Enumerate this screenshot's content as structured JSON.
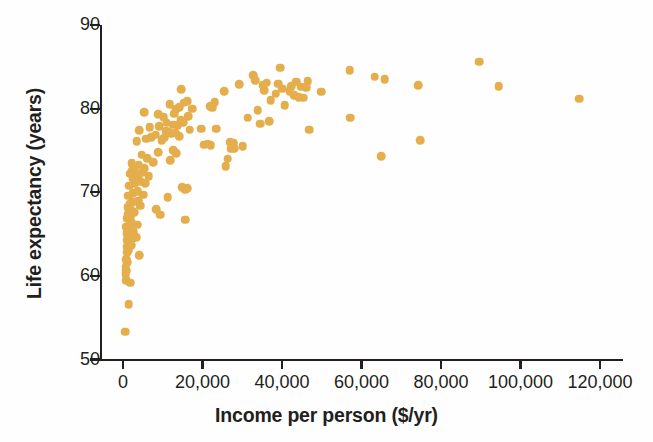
{
  "chart_data": {
    "type": "scatter",
    "title": "",
    "xlabel": "Income per person ($/yr)",
    "ylabel": "Life expectancy (years)",
    "xlim": [
      -4000,
      126000
    ],
    "ylim": [
      50,
      90
    ],
    "xticks": [
      0,
      20000,
      40000,
      60000,
      80000,
      100000,
      120000
    ],
    "xtick_labels": [
      "0",
      "20,000",
      "40,000",
      "60,000",
      "80,000",
      "100,000",
      "120,000"
    ],
    "yticks": [
      50,
      60,
      70,
      80,
      90
    ],
    "ytick_labels": [
      "50",
      "60",
      "70",
      "80",
      "90"
    ],
    "grid": false,
    "legend": null,
    "marker_color": "#e4ae4c",
    "axis_color": "#231f20",
    "marker_size": 8.6,
    "points": [
      [
        620,
        53.3
      ],
      [
        1460,
        56.6
      ],
      [
        1840,
        59.2
      ],
      [
        760,
        59.5
      ],
      [
        700,
        60.2
      ],
      [
        880,
        60.6
      ],
      [
        660,
        61.1
      ],
      [
        1010,
        61.6
      ],
      [
        820,
        62.0
      ],
      [
        4050,
        62.5
      ],
      [
        1130,
        62.8
      ],
      [
        1280,
        63.1
      ],
      [
        900,
        63.5
      ],
      [
        2020,
        63.7
      ],
      [
        1700,
        64.0
      ],
      [
        1090,
        64.3
      ],
      [
        2440,
        64.5
      ],
      [
        3300,
        64.6
      ],
      [
        1310,
        64.8
      ],
      [
        900,
        65.1
      ],
      [
        2650,
        65.3
      ],
      [
        1140,
        65.5
      ],
      [
        1560,
        65.7
      ],
      [
        760,
        65.9
      ],
      [
        3590,
        66.1
      ],
      [
        2120,
        66.4
      ],
      [
        15600,
        66.7
      ],
      [
        1020,
        66.9
      ],
      [
        1920,
        67.1
      ],
      [
        9300,
        67.3
      ],
      [
        1350,
        67.4
      ],
      [
        2890,
        67.6
      ],
      [
        2160,
        67.8
      ],
      [
        8400,
        68.0
      ],
      [
        1190,
        68.2
      ],
      [
        4300,
        68.4
      ],
      [
        1640,
        68.6
      ],
      [
        2380,
        68.8
      ],
      [
        3780,
        69.0
      ],
      [
        11200,
        69.4
      ],
      [
        1330,
        69.6
      ],
      [
        5150,
        69.7
      ],
      [
        2480,
        69.9
      ],
      [
        3650,
        70.1
      ],
      [
        15700,
        70.3
      ],
      [
        16200,
        70.5
      ],
      [
        14900,
        70.6
      ],
      [
        1520,
        70.8
      ],
      [
        2900,
        71.0
      ],
      [
        5600,
        71.1
      ],
      [
        4400,
        71.3
      ],
      [
        3120,
        71.5
      ],
      [
        2400,
        71.7
      ],
      [
        6500,
        71.9
      ],
      [
        3550,
        72.0
      ],
      [
        1850,
        72.2
      ],
      [
        4900,
        72.4
      ],
      [
        2280,
        72.6
      ],
      [
        2750,
        72.8
      ],
      [
        5300,
        72.9
      ],
      [
        25800,
        73.1
      ],
      [
        3900,
        73.3
      ],
      [
        2150,
        73.5
      ],
      [
        7600,
        73.6
      ],
      [
        11900,
        73.8
      ],
      [
        26300,
        74.0
      ],
      [
        6100,
        74.1
      ],
      [
        64900,
        74.3
      ],
      [
        4700,
        74.5
      ],
      [
        13400,
        74.7
      ],
      [
        8900,
        74.8
      ],
      [
        12700,
        75.0
      ],
      [
        27200,
        75.2
      ],
      [
        28000,
        75.3
      ],
      [
        30100,
        75.5
      ],
      [
        22100,
        75.6
      ],
      [
        20400,
        75.7
      ],
      [
        21300,
        75.8
      ],
      [
        27900,
        75.9
      ],
      [
        26900,
        76.0
      ],
      [
        3400,
        76.1
      ],
      [
        9700,
        76.2
      ],
      [
        5900,
        76.4
      ],
      [
        74700,
        76.2
      ],
      [
        10400,
        76.5
      ],
      [
        7100,
        76.6
      ],
      [
        14200,
        76.7
      ],
      [
        8200,
        76.9
      ],
      [
        12200,
        77.0
      ],
      [
        13100,
        77.1
      ],
      [
        11500,
        77.2
      ],
      [
        10900,
        77.3
      ],
      [
        4100,
        77.4
      ],
      [
        16800,
        77.5
      ],
      [
        19600,
        77.6
      ],
      [
        23400,
        77.6
      ],
      [
        46900,
        77.5
      ],
      [
        6700,
        77.8
      ],
      [
        9100,
        77.9
      ],
      [
        13800,
        78.0
      ],
      [
        12600,
        78.1
      ],
      [
        34500,
        78.2
      ],
      [
        11000,
        78.3
      ],
      [
        15100,
        78.4
      ],
      [
        36800,
        78.5
      ],
      [
        14500,
        78.6
      ],
      [
        57200,
        78.9
      ],
      [
        31400,
        78.9
      ],
      [
        10200,
        79.0
      ],
      [
        16400,
        79.1
      ],
      [
        8800,
        79.3
      ],
      [
        12900,
        79.4
      ],
      [
        5400,
        79.6
      ],
      [
        33900,
        79.8
      ],
      [
        13300,
        79.9
      ],
      [
        17400,
        80.0
      ],
      [
        22500,
        80.1
      ],
      [
        14100,
        80.2
      ],
      [
        21900,
        80.3
      ],
      [
        40700,
        80.4
      ],
      [
        11800,
        80.5
      ],
      [
        15300,
        80.7
      ],
      [
        23100,
        80.8
      ],
      [
        16100,
        80.9
      ],
      [
        37200,
        81.0
      ],
      [
        114800,
        81.2
      ],
      [
        45400,
        81.3
      ],
      [
        44200,
        81.4
      ],
      [
        43100,
        81.6
      ],
      [
        38400,
        81.8
      ],
      [
        49900,
        82.0
      ],
      [
        14700,
        82.3
      ],
      [
        35500,
        82.2
      ],
      [
        41900,
        82.1
      ],
      [
        25400,
        82.1
      ],
      [
        40100,
        82.4
      ],
      [
        46100,
        82.5
      ],
      [
        44800,
        82.6
      ],
      [
        42300,
        82.7
      ],
      [
        35100,
        82.8
      ],
      [
        94500,
        82.7
      ],
      [
        74300,
        82.8
      ],
      [
        29200,
        82.9
      ],
      [
        39100,
        83.0
      ],
      [
        36200,
        83.1
      ],
      [
        43600,
        83.2
      ],
      [
        46500,
        83.3
      ],
      [
        33200,
        83.4
      ],
      [
        65800,
        83.5
      ],
      [
        63300,
        83.8
      ],
      [
        32700,
        84.0
      ],
      [
        57000,
        84.6
      ],
      [
        39600,
        84.9
      ],
      [
        89600,
        85.6
      ]
    ]
  }
}
